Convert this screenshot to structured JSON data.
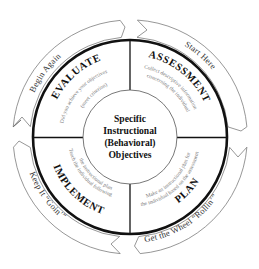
{
  "diagram": {
    "center": {
      "lines": [
        "Specific",
        "Instructional",
        "(Behavioral)",
        "Objectives"
      ]
    },
    "quadrants": [
      {
        "id": "assessment",
        "position": "top-right",
        "title": "ASSESSMENT",
        "description_lines": [
          "Collect descriptive information",
          "concerning the individual"
        ]
      },
      {
        "id": "plan",
        "position": "bottom-right",
        "title": "PLAN",
        "description_lines": [
          "Make an instructional plan for",
          "the individual based on the assessment"
        ]
      },
      {
        "id": "implement",
        "position": "bottom-left",
        "title": "IMPLEMENT",
        "description_lines": [
          "Teach the individual following",
          "the instructional plan"
        ]
      },
      {
        "id": "evaluate",
        "position": "top-left",
        "title": "EVALUATE",
        "description_lines": [
          "Did you achieve your objectives",
          "(meet criterion)"
        ]
      }
    ],
    "banners": [
      {
        "id": "start-here",
        "position": "top-right",
        "label": "Start Here"
      },
      {
        "id": "get-the-wheel-rollin",
        "position": "bottom-right",
        "label": "Get the Wheel “Rollin’”"
      },
      {
        "id": "keep-it-goin",
        "position": "bottom-left",
        "label": "Keep It “Goin’”"
      },
      {
        "id": "begin-again",
        "position": "top-left",
        "label": "Begin Again"
      }
    ],
    "flow_direction": "clockwise",
    "colors": {
      "outline": "#111111",
      "ribbon_stroke": "#6a6a6a",
      "description_text": "#777777",
      "background": "#ffffff"
    }
  }
}
